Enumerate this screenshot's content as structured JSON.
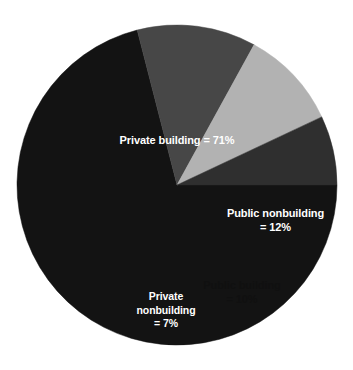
{
  "chart_data": {
    "type": "pie",
    "title": "",
    "subtitle": "",
    "xlabel": "",
    "ylabel": "",
    "legend_position": "none",
    "grid": false,
    "labels_inside_slices": true,
    "start_angle_deg": 0,
    "direction": "clockwise",
    "categories": [
      "Private building",
      "Public nonbuilding",
      "Public building",
      "Private nonbuilding"
    ],
    "values": [
      71,
      12,
      10,
      7
    ],
    "units": "%",
    "total": 100,
    "slices": [
      {
        "name": "Private building",
        "value": 71,
        "value_text": "71%",
        "label_text": "Private building = 71%",
        "color": "#131313",
        "text_color": "#ffffff",
        "start_angle_deg": 0,
        "end_angle_deg": 255.6
      },
      {
        "name": "Public nonbuilding",
        "value": 12,
        "value_text": "12%",
        "label_text": "Public nonbuilding\n= 12%",
        "color": "#474747",
        "text_color": "#ffffff",
        "start_angle_deg": 316.8,
        "end_angle_deg": 360
      },
      {
        "name": "Public building",
        "value": 10,
        "value_text": "10%",
        "label_text": "Public building\n= 10%",
        "color": "#b2b2b2",
        "text_color": "#101010",
        "start_angle_deg": 280.8,
        "end_angle_deg": 316.8
      },
      {
        "name": "Private nonbuilding",
        "value": 7,
        "value_text": "7%",
        "label_text": "Private\nnonbuilding\n= 7%",
        "color": "#2f2f2f",
        "text_color": "#ffffff",
        "start_angle_deg": 255.6,
        "end_angle_deg": 280.8
      }
    ],
    "background_color": "#ffffff"
  },
  "figure": {
    "center_x": 177,
    "center_y": 185,
    "radius": 160
  }
}
